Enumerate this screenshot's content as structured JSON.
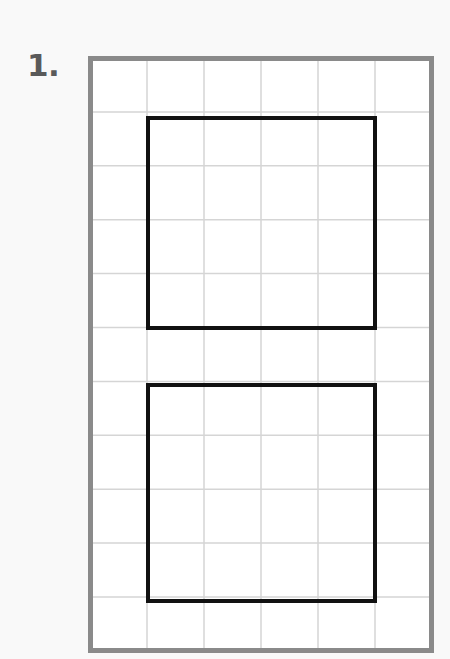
{
  "worksheet": {
    "problem_number_label": "1.",
    "background_color": "#f9f9f9"
  },
  "grid": {
    "columns": 6,
    "rows": 11,
    "x": 90,
    "y": 58,
    "width": 342,
    "height": 593,
    "cell_width": 57,
    "cell_height": 53.9,
    "border_color": "#8a8a8a",
    "border_width": 5,
    "gridline_color": "#d5d5d5",
    "gridline_width": 1.5
  },
  "shapes": [
    {
      "name": "upper-rectangle",
      "type": "rectangle",
      "stroke_color": "#111111",
      "stroke_width": 4,
      "fill": "none",
      "col_start": 1,
      "col_end": 5,
      "row_start": 1,
      "row_end": 5,
      "x": 148,
      "y": 118,
      "width": 227,
      "height": 210,
      "grid_units_wide": 4,
      "grid_units_tall": 4,
      "area_squares": 16,
      "perimeter_units": 16
    },
    {
      "name": "lower-rectangle",
      "type": "rectangle",
      "stroke_color": "#111111",
      "stroke_width": 4,
      "fill": "none",
      "col_start": 1,
      "col_end": 5,
      "row_start": 6,
      "row_end": 10,
      "x": 148,
      "y": 385,
      "width": 227,
      "height": 216,
      "grid_units_wide": 4,
      "grid_units_tall": 4,
      "area_squares": 16,
      "perimeter_units": 16
    }
  ]
}
